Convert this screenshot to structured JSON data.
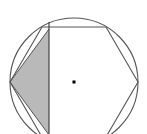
{
  "figure": {
    "canvas": {
      "width": 147,
      "height": 134,
      "background_color": "#ffffff"
    },
    "center_point": {
      "label": "center-dot",
      "x": 74,
      "y": 82,
      "size": 3,
      "color": "#000000"
    },
    "circle": {
      "label": "circumscribed-circle",
      "cx": 74,
      "cy": 82,
      "r": 64,
      "stroke_color": "#555555",
      "stroke_width": 1.1,
      "fill": "none"
    },
    "hexagon": {
      "label": "inscribed-regular-hexagon",
      "sides": 6,
      "stroke_color": "#555555",
      "stroke_width": 1.1,
      "fill": "none",
      "vertices": [
        {
          "name": "right",
          "x": 138,
          "y": 82
        },
        {
          "name": "top-right",
          "x": 106,
          "y": 27
        },
        {
          "name": "top-left",
          "x": 42,
          "y": 27
        },
        {
          "name": "left",
          "x": 10,
          "y": 82
        },
        {
          "name": "bottom-left",
          "x": 42,
          "y": 137
        },
        {
          "name": "bottom-right",
          "x": 106,
          "y": 137
        }
      ]
    },
    "chord": {
      "label": "vertical-chord",
      "x": 49,
      "y1": 22,
      "y2": 142,
      "stroke_color": "#444444",
      "stroke_width": 1.2
    },
    "shaded_region": {
      "label": "shaded-left-region",
      "fill_color": "#b9b9b9",
      "fill_opacity": 1,
      "stroke_color": "#6a6a6a",
      "stroke_width": 1,
      "description": "Region left of the vertical chord bounded by two hexagon edges",
      "polygon_points": [
        {
          "x": 49,
          "y": 29
        },
        {
          "x": 10,
          "y": 82
        },
        {
          "x": 49,
          "y": 135
        }
      ]
    },
    "radii_lines": {
      "label": "hexagon-diagonals-left",
      "stroke_color": "#555555",
      "stroke_width": 1,
      "segments": [
        {
          "x1": 10,
          "y1": 82,
          "x2": 49,
          "y2": 29
        },
        {
          "x1": 10,
          "y1": 82,
          "x2": 49,
          "y2": 135
        }
      ]
    }
  }
}
